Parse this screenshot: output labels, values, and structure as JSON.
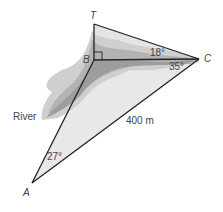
{
  "diagram": {
    "points": {
      "T": {
        "label": "T",
        "x": 94,
        "y": 24
      },
      "B": {
        "label": "B",
        "x": 94,
        "y": 60
      },
      "C": {
        "label": "C",
        "x": 199,
        "y": 59
      },
      "A": {
        "label": "A",
        "x": 32,
        "y": 183
      }
    },
    "angles": {
      "TCB": "18°",
      "BCA": "35°",
      "BAC": "27°"
    },
    "lengths": {
      "AC": "400 m"
    },
    "labels": {
      "river": "River"
    },
    "colors": {
      "line": "#222222",
      "river_dark": "#9a9a9a",
      "river_mid": "#b8b8b8",
      "river_light": "#d4d4d4",
      "fill": "#e6e6e6"
    }
  }
}
